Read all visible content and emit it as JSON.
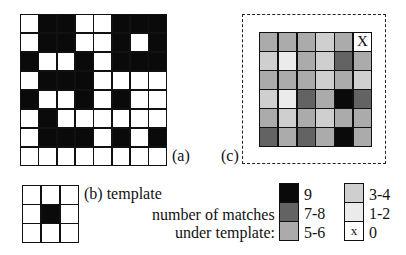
{
  "labels": {
    "a": "(a)",
    "b": "(b) template",
    "c": "(c)",
    "legend_title_line1": "number of matches",
    "legend_title_line2": "under template:"
  },
  "grid_a": {
    "rows": 8,
    "cols": 8,
    "cells": [
      [
        0,
        1,
        1,
        0,
        0,
        1,
        1,
        1
      ],
      [
        0,
        1,
        1,
        0,
        0,
        1,
        0,
        1
      ],
      [
        1,
        0,
        0,
        1,
        0,
        1,
        1,
        1
      ],
      [
        0,
        1,
        1,
        1,
        0,
        0,
        0,
        0
      ],
      [
        1,
        0,
        0,
        1,
        0,
        1,
        0,
        0
      ],
      [
        0,
        1,
        0,
        0,
        0,
        0,
        0,
        0
      ],
      [
        0,
        1,
        1,
        1,
        0,
        1,
        0,
        1
      ],
      [
        0,
        0,
        0,
        0,
        0,
        0,
        0,
        0
      ]
    ]
  },
  "template": {
    "rows": 3,
    "cols": 3,
    "cells": [
      [
        0,
        0,
        0
      ],
      [
        0,
        1,
        0
      ],
      [
        0,
        0,
        0
      ]
    ]
  },
  "grid_c": {
    "rows": 6,
    "cols": 6,
    "match_counts": [
      [
        5,
        5,
        5,
        4,
        5,
        0
      ],
      [
        3,
        2,
        6,
        4,
        7,
        5
      ],
      [
        6,
        5,
        6,
        3,
        5,
        4
      ],
      [
        4,
        3,
        7,
        5,
        9,
        7
      ],
      [
        6,
        3,
        5,
        4,
        6,
        5
      ],
      [
        7,
        6,
        8,
        6,
        9,
        6
      ]
    ],
    "classes": [
      [
        3,
        3,
        3,
        2,
        3,
        0
      ],
      [
        2,
        1,
        3,
        2,
        4,
        3
      ],
      [
        3,
        3,
        3,
        2,
        3,
        2
      ],
      [
        2,
        1,
        4,
        3,
        5,
        4
      ],
      [
        3,
        2,
        3,
        2,
        3,
        3
      ],
      [
        4,
        3,
        4,
        3,
        5,
        3
      ]
    ],
    "zero_mark": "X"
  },
  "legend": {
    "left": [
      {
        "label": "9",
        "class": 5,
        "color": "#0a0a0a"
      },
      {
        "label": "7-8",
        "class": 4,
        "color": "#636363"
      },
      {
        "label": "5-6",
        "class": 3,
        "color": "#ababab"
      }
    ],
    "right": [
      {
        "label": "3-4",
        "class": 2,
        "color": "#cfcfcf"
      },
      {
        "label": "1-2",
        "class": 1,
        "color": "#ebebeb"
      },
      {
        "label": "0",
        "class": 0,
        "color": "#ffffff",
        "mark": "x"
      }
    ]
  }
}
